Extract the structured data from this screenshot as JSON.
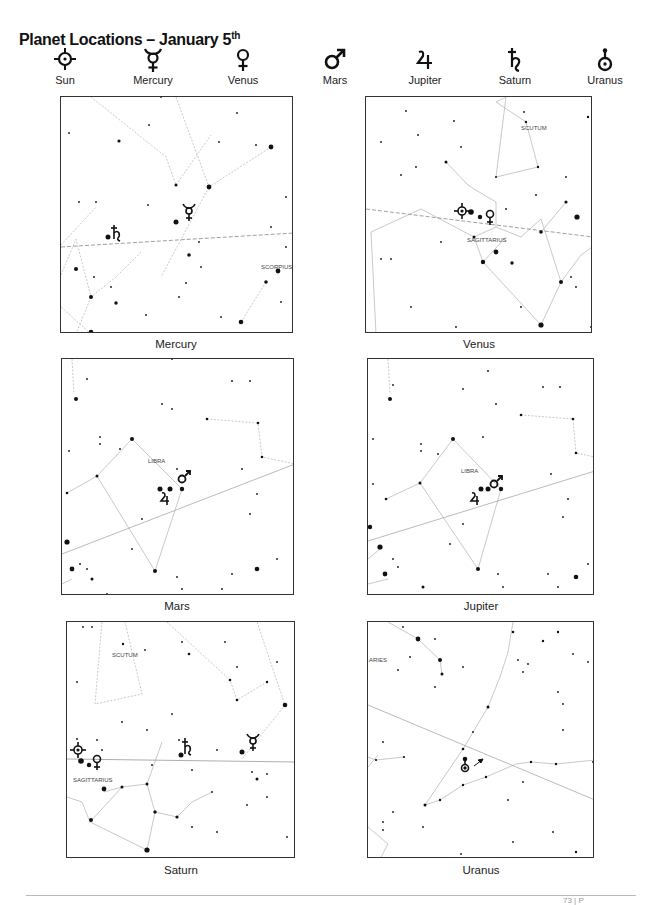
{
  "title": {
    "text": "Planet Locations – January 5",
    "superscript": "th"
  },
  "legend": [
    {
      "name": "Sun",
      "icon": "sun-symbol-icon"
    },
    {
      "name": "Mercury",
      "icon": "mercury-symbol-icon"
    },
    {
      "name": "Venus",
      "icon": "venus-symbol-icon"
    },
    {
      "name": "Mars",
      "icon": "mars-symbol-icon"
    },
    {
      "name": "Jupiter",
      "icon": "jupiter-symbol-icon"
    },
    {
      "name": "Saturn",
      "icon": "saturn-symbol-icon"
    },
    {
      "name": "Uranus",
      "icon": "uranus-symbol-icon"
    }
  ],
  "panels": [
    {
      "caption": "Mercury",
      "constellations": [
        "SCORPIUS"
      ]
    },
    {
      "caption": "Venus",
      "constellations": [
        "SCUTUM",
        "SAGITTARIUS"
      ]
    },
    {
      "caption": "Mars",
      "constellations": [
        "LIBRA"
      ]
    },
    {
      "caption": "Jupiter",
      "constellations": [
        "LIBRA"
      ]
    },
    {
      "caption": "Saturn",
      "constellations": [
        "SCUTUM",
        "SAGITTARIUS"
      ]
    },
    {
      "caption": "Uranus",
      "constellations": [
        "ARIES"
      ]
    }
  ],
  "footer": {
    "text": "73 | P"
  }
}
